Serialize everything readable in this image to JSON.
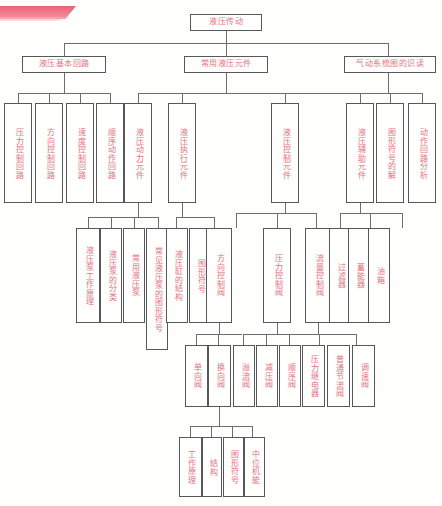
{
  "meta": {
    "diagram_title": "液压传动",
    "node_text_color": "#e8707f",
    "border_color": "#58585a",
    "line_color": "#6d6d70",
    "banner_color": "#e8566a",
    "page_background": "#fefefc"
  },
  "nodes": {
    "root": "液压传动",
    "lvl2": {
      "basic_circuits": "液压基本回路",
      "common_components": "常用液压元件",
      "pneumatic_reading": "气动系统图的识读"
    },
    "lvl3": {
      "pressure_circuit": "压力控制回路",
      "direction_circuit": "方向控制回路",
      "speed_circuit": "速度控制回路",
      "sequence_circuit": "顺序动作回路",
      "power_element": "液压动力元件",
      "actuator_element": "液压执行元件",
      "control_element": "液压控制元件",
      "auxiliary_element": "液压辅助元件",
      "symbol_explain": "图形符号的解",
      "circuit_analysis": "动作回路分析"
    },
    "lvl4": {
      "pump_principle": "液压泵工作原理",
      "pump_types": "液压泵的分类",
      "common_pumps": "常用液压泵",
      "pump_symbols": "常见液压泵的图形符号",
      "cylinder_structure": "液压缸的结构",
      "cylinder_symbol": "图形符号",
      "direction_valve": "方向控制阀",
      "pressure_valve": "压力控制阀",
      "flow_valve": "流量控制阀",
      "filter": "过滤器",
      "accumulator": "蓄能器",
      "tank": "油箱"
    },
    "lvl5": {
      "check_valve": "单向阀",
      "reversing_valve": "换向阀",
      "relief_valve": "溢流阀",
      "reducing_valve": "减压阀",
      "sequence_valve": "顺序阀",
      "pressure_relay": "压力继电器",
      "throttle_valve": "普通节流阀",
      "speed_valve": "调速阀"
    },
    "lvl6": {
      "work_principle": "工作原理",
      "structure": "结构",
      "graphic_symbol": "图形符号",
      "neutral_function": "中位机能"
    }
  }
}
